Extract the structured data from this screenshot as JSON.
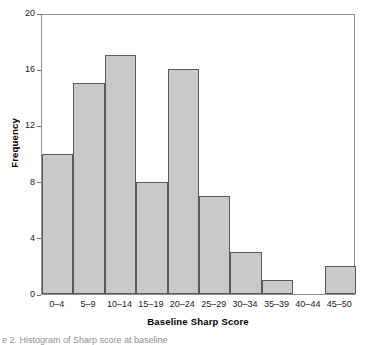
{
  "figure": {
    "caption": "e 2. Histogram of Sharp score at baseline"
  },
  "chart_data": {
    "type": "bar",
    "title": "",
    "subtitle": "",
    "xlabel": "Baseline Sharp Score",
    "ylabel": "Frequency",
    "categories": [
      "0–4",
      "5–9",
      "10–14",
      "15–19",
      "20–24",
      "25–29",
      "30–34",
      "35–39",
      "40–44",
      "45–50"
    ],
    "values": [
      10,
      15,
      17,
      8,
      16,
      7,
      3,
      1,
      0,
      2
    ],
    "ylim": [
      0,
      20
    ],
    "y_ticks": [
      0,
      4,
      8,
      12,
      16,
      20
    ],
    "grid": false,
    "legend": false,
    "legend_position": "none",
    "bar_fill_color": "#c9c9c9",
    "bar_edge_color": "#5a5a5a",
    "frame_color": "#8c8c8c",
    "background_color": "#ffffff",
    "text_color": "#1a1a1a"
  }
}
